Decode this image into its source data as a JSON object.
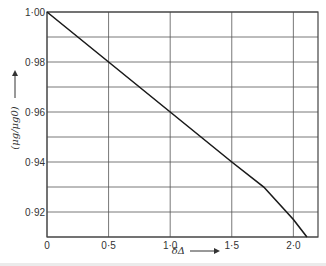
{
  "chart_data": {
    "type": "line",
    "title": "",
    "xlabel": "δΔ",
    "ylabel": "(μg/μg0)",
    "xlim": [
      0,
      2.2
    ],
    "ylim": [
      0.91,
      1.0
    ],
    "x_ticks": [
      0,
      0.5,
      1.0,
      1.5,
      2.0
    ],
    "x_tick_labels": [
      "0",
      "0·5",
      "1·0",
      "1·5",
      "2·0"
    ],
    "y_ticks": [
      1.0,
      0.98,
      0.96,
      0.94,
      0.92
    ],
    "y_tick_labels": [
      "1·00",
      "0·98",
      "0·96",
      "0·94",
      "0·92"
    ],
    "y_gridlines": [
      1.0,
      0.99,
      0.98,
      0.97,
      0.96,
      0.95,
      0.94,
      0.93,
      0.92,
      0.91
    ],
    "x_gridlines": [
      0,
      0.5,
      1.0,
      1.5,
      2.0
    ],
    "grid": true,
    "legend": null,
    "series": [
      {
        "name": "μg/μg0",
        "x": [
          0,
          0.5,
          1.0,
          1.5,
          1.76,
          2.0,
          2.11
        ],
        "y": [
          1.0,
          0.98,
          0.96,
          0.94,
          0.93,
          0.917,
          0.91
        ]
      }
    ]
  },
  "axes": {
    "x_label": "δΔ",
    "x_arrow": "→",
    "y_label": "(μg/μg0)",
    "y_arrow": "→"
  },
  "colors": {
    "line": "#1a1a1a",
    "grid": "#555555",
    "background": "#ffffff"
  }
}
